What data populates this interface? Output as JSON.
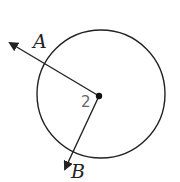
{
  "diagram": {
    "type": "circle-with-rays",
    "circle": {
      "cx": 101,
      "cy": 94,
      "r": 64,
      "stroke": "#222222"
    },
    "vertex": {
      "x": 99,
      "y": 96,
      "label": "2"
    },
    "rays": [
      {
        "name": "A",
        "label": "A",
        "end": {
          "x": 8,
          "y": 42
        }
      },
      {
        "name": "B",
        "label": "B",
        "end": {
          "x": 64,
          "y": 171
        }
      }
    ],
    "colors": {
      "ink": "#222222",
      "angle_label": "#666666",
      "background": "#ffffff"
    }
  }
}
